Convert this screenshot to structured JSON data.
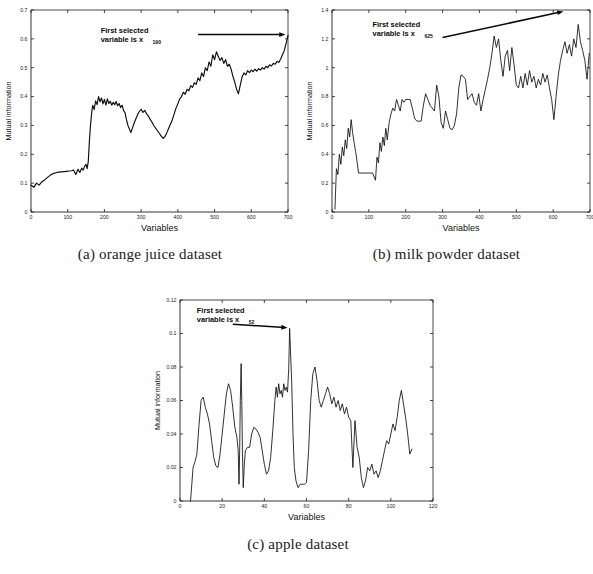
{
  "figure": {
    "name": "mutual-information-variable-selection-figure",
    "panels": [
      {
        "id": "a",
        "caption": "(a) orange juice dataset",
        "annotation_line1": "First selected",
        "annotation_line2": "variable is x",
        "annotation_subscript": "190"
      },
      {
        "id": "b",
        "caption": "(b) milk powder dataset",
        "annotation_line1": "First selected",
        "annotation_line2": "variable is x",
        "annotation_subscript": "625"
      },
      {
        "id": "c",
        "caption": "(c) apple dataset",
        "annotation_line1": "First selected",
        "annotation_line2": "variable is x",
        "annotation_subscript": "52"
      }
    ]
  },
  "chart_data": [
    {
      "type": "line",
      "panel": "a",
      "title": "",
      "xlabel": "Variables",
      "ylabel": "Mutual information",
      "xlim": [
        0,
        700
      ],
      "ylim": [
        0,
        0.7
      ],
      "xticks": [
        0,
        100,
        200,
        300,
        400,
        500,
        600,
        700
      ],
      "xticklabels": [
        "0",
        "100",
        "200",
        "300",
        "400",
        "500",
        "600",
        "700"
      ],
      "yticks": [
        0,
        0.1,
        0.2,
        0.3,
        0.4,
        0.5,
        0.6,
        0.7
      ],
      "yticklabels": [
        "0",
        "0.1",
        "0.2",
        "0.3",
        "0.4",
        "0.5",
        "0.6",
        "0.7"
      ],
      "grid": false,
      "legend": null,
      "annotations": [
        {
          "text": "First selected variable is x190",
          "x": 190,
          "y": 0.62,
          "arrow_from": [
            455,
            0.615
          ],
          "arrow_to": [
            693,
            0.615
          ]
        }
      ],
      "series": [
        {
          "name": "mutual information",
          "x": [
            0,
            8,
            15,
            22,
            30,
            38,
            45,
            52,
            60,
            68,
            75,
            82,
            90,
            97,
            104,
            110,
            116,
            122,
            128,
            133,
            138,
            142,
            146,
            150,
            153,
            156,
            159,
            162,
            165,
            168,
            172,
            176,
            180,
            184,
            188,
            192,
            196,
            200,
            204,
            208,
            212,
            216,
            220,
            224,
            228,
            232,
            236,
            240,
            244,
            248,
            252,
            256,
            260,
            264,
            268,
            272,
            276,
            280,
            284,
            288,
            292,
            296,
            300,
            305,
            310,
            315,
            320,
            325,
            330,
            335,
            340,
            345,
            350,
            355,
            360,
            365,
            370,
            375,
            380,
            385,
            390,
            395,
            400,
            405,
            410,
            415,
            420,
            425,
            430,
            435,
            440,
            445,
            450,
            455,
            460,
            465,
            470,
            475,
            480,
            485,
            490,
            495,
            500,
            505,
            510,
            515,
            520,
            525,
            530,
            535,
            540,
            545,
            550,
            555,
            560,
            565,
            570,
            575,
            580,
            585,
            590,
            595,
            600,
            605,
            610,
            615,
            620,
            625,
            630,
            635,
            640,
            645,
            650,
            655,
            660,
            665,
            670,
            675,
            680,
            685,
            690,
            695,
            700
          ],
          "y": [
            0.093,
            0.086,
            0.1,
            0.093,
            0.105,
            0.112,
            0.12,
            0.127,
            0.133,
            0.136,
            0.138,
            0.139,
            0.14,
            0.141,
            0.142,
            0.143,
            0.145,
            0.13,
            0.148,
            0.137,
            0.152,
            0.145,
            0.158,
            0.165,
            0.15,
            0.175,
            0.245,
            0.3,
            0.34,
            0.37,
            0.355,
            0.385,
            0.372,
            0.4,
            0.382,
            0.395,
            0.375,
            0.39,
            0.37,
            0.392,
            0.376,
            0.384,
            0.37,
            0.38,
            0.372,
            0.383,
            0.368,
            0.376,
            0.362,
            0.37,
            0.352,
            0.344,
            0.32,
            0.3,
            0.288,
            0.275,
            0.29,
            0.305,
            0.318,
            0.33,
            0.342,
            0.35,
            0.356,
            0.345,
            0.352,
            0.34,
            0.332,
            0.32,
            0.31,
            0.298,
            0.29,
            0.28,
            0.272,
            0.262,
            0.255,
            0.262,
            0.275,
            0.29,
            0.305,
            0.32,
            0.34,
            0.36,
            0.375,
            0.392,
            0.4,
            0.415,
            0.408,
            0.425,
            0.42,
            0.438,
            0.432,
            0.448,
            0.442,
            0.465,
            0.455,
            0.482,
            0.47,
            0.5,
            0.49,
            0.52,
            0.505,
            0.545,
            0.528,
            0.555,
            0.54,
            0.525,
            0.535,
            0.515,
            0.528,
            0.505,
            0.512,
            0.495,
            0.47,
            0.45,
            0.425,
            0.41,
            0.44,
            0.468,
            0.482,
            0.475,
            0.49,
            0.483,
            0.492,
            0.486,
            0.495,
            0.488,
            0.497,
            0.492,
            0.5,
            0.495,
            0.505,
            0.5,
            0.51,
            0.506,
            0.515,
            0.512,
            0.522,
            0.518,
            0.53,
            0.545,
            0.56,
            0.585,
            0.612
          ]
        }
      ]
    },
    {
      "type": "line",
      "panel": "b",
      "title": "",
      "xlabel": "Variables",
      "ylabel": "Mutual information",
      "xlim": [
        0,
        700
      ],
      "ylim": [
        0,
        1.4
      ],
      "xticks": [
        0,
        100,
        200,
        300,
        400,
        500,
        600,
        700
      ],
      "xticklabels": [
        "0",
        "100",
        "200",
        "300",
        "400",
        "500",
        "600",
        "700"
      ],
      "yticks": [
        0,
        0.2,
        0.4,
        0.6,
        0.8,
        1.0,
        1.2,
        1.4
      ],
      "yticklabels": [
        "0",
        "0.2",
        "0.4",
        "0.6",
        "0.8",
        "1",
        "1.2",
        "1.4"
      ],
      "grid": false,
      "legend": null,
      "annotations": [
        {
          "text": "First selected variable is x625",
          "x": 110,
          "y": 1.28,
          "arrow_from": [
            300,
            1.21
          ],
          "arrow_to": [
            628,
            1.39
          ]
        }
      ],
      "series": [
        {
          "name": "mutual information",
          "x": [
            8,
            12,
            16,
            20,
            24,
            28,
            32,
            36,
            40,
            44,
            48,
            52,
            56,
            60,
            64,
            68,
            72,
            80,
            90,
            100,
            110,
            118,
            122,
            126,
            130,
            134,
            138,
            142,
            146,
            150,
            155,
            160,
            165,
            170,
            175,
            180,
            185,
            190,
            195,
            200,
            206,
            212,
            218,
            224,
            230,
            236,
            242,
            248,
            254,
            260,
            266,
            272,
            278,
            284,
            290,
            296,
            302,
            308,
            314,
            320,
            326,
            332,
            338,
            344,
            350,
            356,
            362,
            368,
            374,
            380,
            386,
            392,
            398,
            404,
            410,
            416,
            422,
            428,
            434,
            440,
            446,
            452,
            458,
            464,
            470,
            476,
            482,
            488,
            494,
            500,
            506,
            512,
            518,
            524,
            530,
            536,
            542,
            548,
            554,
            560,
            566,
            572,
            578,
            584,
            590,
            596,
            602,
            608,
            614,
            620,
            626,
            632,
            638,
            644,
            650,
            656,
            662,
            668,
            674,
            680,
            686,
            692,
            698
          ],
          "y": [
            0.02,
            0.3,
            0.26,
            0.4,
            0.33,
            0.45,
            0.39,
            0.5,
            0.44,
            0.58,
            0.52,
            0.64,
            0.55,
            0.48,
            0.42,
            0.35,
            0.27,
            0.27,
            0.27,
            0.27,
            0.27,
            0.22,
            0.38,
            0.34,
            0.48,
            0.42,
            0.52,
            0.46,
            0.58,
            0.5,
            0.62,
            0.68,
            0.72,
            0.7,
            0.78,
            0.74,
            0.7,
            0.78,
            0.76,
            0.78,
            0.78,
            0.78,
            0.72,
            0.65,
            0.63,
            0.63,
            0.63,
            0.74,
            0.82,
            0.78,
            0.74,
            0.72,
            0.7,
            0.88,
            0.8,
            0.62,
            0.58,
            0.7,
            0.64,
            0.58,
            0.57,
            0.6,
            0.68,
            0.86,
            0.95,
            0.94,
            0.92,
            0.78,
            0.8,
            0.82,
            0.76,
            0.74,
            0.82,
            0.7,
            0.78,
            0.85,
            0.92,
            1.0,
            1.1,
            1.22,
            1.14,
            1.2,
            1.05,
            0.94,
            1.08,
            1.12,
            0.98,
            1.14,
            1.02,
            0.88,
            0.86,
            0.94,
            0.86,
            0.96,
            0.88,
            0.98,
            0.9,
            0.94,
            0.86,
            0.92,
            0.88,
            0.96,
            0.9,
            0.95,
            0.86,
            0.78,
            0.64,
            0.8,
            0.95,
            1.05,
            1.12,
            1.18,
            1.1,
            1.16,
            1.08,
            1.2,
            1.14,
            1.3,
            1.18,
            1.12,
            1.05,
            0.92,
            1.1,
            1.16,
            1.2
          ]
        }
      ]
    },
    {
      "type": "line",
      "panel": "c",
      "title": "",
      "xlabel": "Variables",
      "ylabel": "Mutual information",
      "xlim": [
        0,
        120
      ],
      "ylim": [
        0,
        0.12
      ],
      "xticks": [
        0,
        20,
        40,
        60,
        80,
        100,
        120
      ],
      "xticklabels": [
        "0",
        "20",
        "40",
        "60",
        "80",
        "100",
        "120"
      ],
      "yticks": [
        0,
        0.02,
        0.04,
        0.06,
        0.08,
        0.1,
        0.12
      ],
      "yticklabels": [
        "0",
        "0.02",
        "0.04",
        "0.06",
        "0.08",
        "0.1",
        "0.12"
      ],
      "grid": false,
      "legend": null,
      "annotations": [
        {
          "text": "First selected variable is x52",
          "x": 8,
          "y": 0.112,
          "arrow_from": [
            25,
            0.1055
          ],
          "arrow_to": [
            51,
            0.1035
          ]
        }
      ],
      "series": [
        {
          "name": "mutual information",
          "x": [
            5.0,
            5.6,
            6.2,
            7.0,
            8.0,
            9.0,
            10.0,
            11.0,
            12.0,
            13.0,
            14.0,
            15.0,
            16.0,
            17.0,
            18.0,
            19.0,
            20.0,
            21.0,
            22.0,
            23.0,
            24.0,
            25.0,
            26.0,
            27.0,
            27.6,
            28.0,
            28.3,
            28.6,
            29.0,
            29.3,
            29.6,
            30.0,
            30.5,
            31.0,
            32.0,
            33.0,
            34.0,
            35.0,
            36.0,
            37.0,
            38.0,
            39.0,
            40.0,
            41.0,
            42.0,
            43.0,
            44.0,
            45.0,
            45.6,
            46.2,
            46.8,
            47.4,
            48.0,
            48.6,
            49.2,
            49.8,
            50.4,
            51.0,
            51.6,
            52.0,
            52.4,
            53.0,
            53.6,
            54.2,
            55.0,
            56.0,
            57.0,
            58.0,
            59.0,
            60.0,
            61.0,
            62.0,
            63.0,
            64.0,
            65.0,
            66.0,
            67.0,
            68.0,
            69.0,
            70.0,
            71.0,
            72.0,
            73.0,
            74.0,
            75.0,
            76.0,
            77.0,
            78.0,
            79.0,
            80.0,
            81.0,
            82.0,
            83.0,
            84.0,
            85.0,
            86.0,
            87.0,
            88.0,
            89.0,
            90.0,
            91.0,
            92.0,
            93.0,
            94.0,
            95.0,
            96.0,
            97.0,
            98.0,
            99.0,
            100.0,
            101.0,
            102.0,
            103.0,
            104.0,
            105.0,
            106.0,
            107.0,
            108.0,
            109.0,
            110.0
          ],
          "y": [
            0.0,
            0.01,
            0.02,
            0.023,
            0.028,
            0.045,
            0.06,
            0.062,
            0.056,
            0.052,
            0.046,
            0.036,
            0.026,
            0.021,
            0.02,
            0.028,
            0.04,
            0.052,
            0.064,
            0.07,
            0.066,
            0.056,
            0.044,
            0.038,
            0.03,
            0.01,
            0.03,
            0.06,
            0.082,
            0.06,
            0.03,
            0.008,
            0.022,
            0.03,
            0.032,
            0.032,
            0.04,
            0.044,
            0.043,
            0.041,
            0.038,
            0.03,
            0.022,
            0.016,
            0.018,
            0.026,
            0.042,
            0.06,
            0.068,
            0.062,
            0.07,
            0.064,
            0.066,
            0.062,
            0.07,
            0.066,
            0.068,
            0.065,
            0.08,
            0.103,
            0.09,
            0.07,
            0.04,
            0.02,
            0.012,
            0.008,
            0.01,
            0.01,
            0.01,
            0.011,
            0.03,
            0.06,
            0.076,
            0.08,
            0.072,
            0.06,
            0.056,
            0.06,
            0.064,
            0.068,
            0.064,
            0.058,
            0.062,
            0.056,
            0.06,
            0.054,
            0.058,
            0.052,
            0.056,
            0.05,
            0.048,
            0.02,
            0.048,
            0.032,
            0.026,
            0.014,
            0.008,
            0.012,
            0.02,
            0.018,
            0.022,
            0.016,
            0.018,
            0.014,
            0.018,
            0.024,
            0.03,
            0.036,
            0.034,
            0.04,
            0.046,
            0.042,
            0.05,
            0.06,
            0.066,
            0.058,
            0.05,
            0.04,
            0.028,
            0.031
          ]
        }
      ]
    }
  ]
}
